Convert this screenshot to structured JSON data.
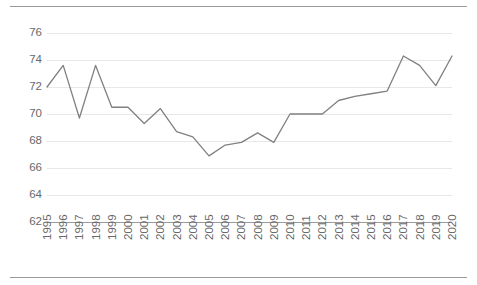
{
  "chart_data": {
    "type": "line",
    "title": "",
    "subtitle": "",
    "xlabel": "",
    "ylabel": "",
    "legend": [],
    "legend_position": "none",
    "grid": true,
    "xlim": [
      1995,
      2020
    ],
    "ylim": [
      62,
      76
    ],
    "ytick_step": 2,
    "yticks": [
      76,
      74,
      72,
      70,
      68,
      66,
      64,
      62
    ],
    "categories": [
      "1995",
      "1996",
      "1997",
      "1998",
      "1999",
      "2000",
      "2001",
      "2002",
      "2003",
      "2004",
      "2005",
      "2006",
      "2007",
      "2008",
      "2009",
      "2010",
      "2011",
      "2012",
      "2013",
      "2014",
      "2015",
      "2016",
      "2017",
      "2018",
      "2019",
      "2020"
    ],
    "x": [
      1995,
      1996,
      1997,
      1998,
      1999,
      2000,
      2001,
      2002,
      2003,
      2004,
      2005,
      2006,
      2007,
      2008,
      2009,
      2010,
      2011,
      2012,
      2013,
      2014,
      2015,
      2016,
      2017,
      2018,
      2019,
      2020
    ],
    "values": [
      72.0,
      73.6,
      69.7,
      73.6,
      70.5,
      70.5,
      69.3,
      70.4,
      68.7,
      68.3,
      66.9,
      67.7,
      67.9,
      68.6,
      67.9,
      70.0,
      70.0,
      70.0,
      71.0,
      71.3,
      71.5,
      71.7,
      74.3,
      73.6,
      72.1,
      74.3
    ],
    "series": [
      {
        "name": "",
        "color": "#808080",
        "values": [
          72.0,
          73.6,
          69.7,
          73.6,
          70.5,
          70.5,
          69.3,
          70.4,
          68.7,
          68.3,
          66.9,
          67.7,
          67.9,
          68.6,
          67.9,
          70.0,
          70.0,
          70.0,
          71.0,
          71.3,
          71.5,
          71.7,
          74.3,
          73.6,
          72.1,
          74.3
        ]
      }
    ],
    "colors": {
      "line": "#808080",
      "gridline": "#e8e8e8",
      "axis": "#9b9b9b",
      "tick_text": "#686868",
      "background": "#ffffff"
    }
  }
}
